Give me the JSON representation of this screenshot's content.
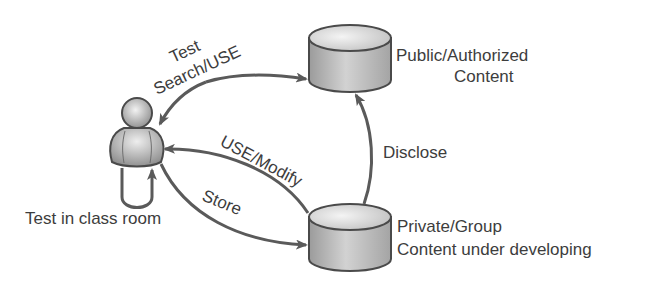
{
  "diagram": {
    "nodes": {
      "user": {
        "label": "",
        "icon": "person-icon"
      },
      "public_store": {
        "label_lines": [
          "Public/Authorized",
          "Content"
        ],
        "icon": "database-cylinder-icon"
      },
      "private_store": {
        "label_lines": [
          "Private/Group",
          "Content under developing"
        ],
        "icon": "database-cylinder-icon"
      }
    },
    "edges": {
      "search_use": {
        "label_lines": [
          "Test",
          "Search/USE"
        ],
        "from": "public_store",
        "to": "user",
        "bidirectional": true
      },
      "use_modify": {
        "label": "USE/Modify",
        "from": "private_store",
        "to": "user"
      },
      "store": {
        "label": "Store",
        "from": "user",
        "to": "private_store"
      },
      "disclose": {
        "label": "Disclose",
        "from": "private_store",
        "to": "public_store"
      },
      "self_loop": {
        "label": "Test in class room",
        "from": "user",
        "to": "user"
      }
    },
    "colors": {
      "stroke": "#555555",
      "fill_light": "#e6e6e6",
      "fill_dark": "#9a9a9a",
      "text": "#3d3d3d"
    }
  }
}
